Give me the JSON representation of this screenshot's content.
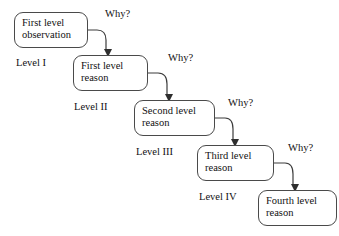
{
  "diagram": {
    "type": "five-whys-cascade",
    "background_color": "#ffffff",
    "box_border_color": "#4a4a4a",
    "arrow_color": "#3c3c3c",
    "text_color": "#111111",
    "nodes": [
      {
        "id": "first-level-observation",
        "line1": "First level",
        "line2": "observation",
        "text": "First level observation",
        "x": 14,
        "y": 12,
        "width": 74,
        "height": 36
      },
      {
        "id": "first-level-reason",
        "line1": "First level",
        "line2": "reason",
        "text": "First level reason",
        "x": 73,
        "y": 55,
        "width": 75,
        "height": 36
      },
      {
        "id": "second-level-reason",
        "line1": "Second level",
        "line2": "reason",
        "text": "Second level reason",
        "x": 134,
        "y": 100,
        "width": 81,
        "height": 36
      },
      {
        "id": "third-level-reason",
        "line1": "Third level",
        "line2": "reason",
        "text": "Third level reason",
        "x": 197,
        "y": 145,
        "width": 77,
        "height": 36
      },
      {
        "id": "fourth-level-reason",
        "line1": "Fourth level",
        "line2": "reason",
        "text": "Fourth level reason",
        "x": 258,
        "y": 190,
        "width": 79,
        "height": 36
      }
    ],
    "level_labels": [
      {
        "id": "level-1",
        "text": "Level I",
        "x": 16,
        "y": 57
      },
      {
        "id": "level-2",
        "text": "Level II",
        "x": 74,
        "y": 101
      },
      {
        "id": "level-3",
        "text": "Level III",
        "x": 136,
        "y": 146
      },
      {
        "id": "level-4",
        "text": "Level IV",
        "x": 199,
        "y": 191
      }
    ],
    "why_labels": [
      {
        "id": "why-1",
        "text": "Why?",
        "x": 105,
        "y": 8
      },
      {
        "id": "why-2",
        "text": "Why?",
        "x": 168,
        "y": 52
      },
      {
        "id": "why-3",
        "text": "Why?",
        "x": 228,
        "y": 97
      },
      {
        "id": "why-4",
        "text": "Why?",
        "x": 288,
        "y": 142
      }
    ],
    "arrows": [
      {
        "id": "arrow-observation-to-first",
        "from": "first-level-observation",
        "to": "first-level-reason",
        "label": "Why?",
        "path": "M 88 30 L 97 30 Q 106 30 106 40 L 106 50",
        "head": "104,49 112,49 108,57"
      },
      {
        "id": "arrow-first-to-second",
        "from": "first-level-reason",
        "to": "second-level-reason",
        "label": "Why?",
        "path": "M 148 73 L 158 73 Q 167 73 167 84 L 167 95",
        "head": "165,94 173,94 169,102"
      },
      {
        "id": "arrow-second-to-third",
        "from": "second-level-reason",
        "to": "third-level-reason",
        "label": "Why?",
        "path": "M 215 118 L 225 118 Q 233 118 233 129 L 233 140",
        "head": "231,139 239,139 235,147"
      },
      {
        "id": "arrow-third-to-fourth",
        "from": "third-level-reason",
        "to": "fourth-level-reason",
        "label": "Why?",
        "path": "M 274 163 L 285 163 Q 293 163 293 174 L 293 185",
        "head": "291,184 299,184 295,192"
      }
    ]
  }
}
